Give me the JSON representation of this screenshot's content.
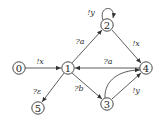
{
  "diagram": {
    "type": "state-transition-graph",
    "nodes": [
      {
        "id": "0",
        "label": "0",
        "x": 19,
        "y": 68
      },
      {
        "id": "1",
        "label": "1",
        "x": 68,
        "y": 68
      },
      {
        "id": "2",
        "label": "2",
        "x": 107,
        "y": 25
      },
      {
        "id": "3",
        "label": "3",
        "x": 107,
        "y": 104
      },
      {
        "id": "4",
        "label": "4",
        "x": 146,
        "y": 68
      },
      {
        "id": "5",
        "label": "5",
        "x": 38,
        "y": 108
      }
    ],
    "edges": [
      {
        "from": "0",
        "to": "1",
        "label": "!x"
      },
      {
        "from": "1",
        "to": "2",
        "label": "?a"
      },
      {
        "from": "2",
        "to": "2",
        "label": "!y"
      },
      {
        "from": "2",
        "to": "4",
        "label": "!x"
      },
      {
        "from": "4",
        "to": "1",
        "label": "?a"
      },
      {
        "from": "1",
        "to": "3",
        "label": "?b"
      },
      {
        "from": "3",
        "to": "4",
        "label": "!y"
      },
      {
        "from": "3",
        "to": "4",
        "label": ""
      },
      {
        "from": "1",
        "to": "5",
        "label": "?ε"
      }
    ]
  }
}
